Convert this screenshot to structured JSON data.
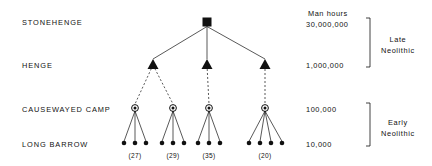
{
  "figure": {
    "type": "hierarchy-diagram",
    "background": "#ffffff",
    "ink": "#111111"
  },
  "row_labels": [
    {
      "id": "stonehenge",
      "label": "STONEHENGE",
      "x": 22,
      "y": 19,
      "node_y": 22
    },
    {
      "id": "henge",
      "label": "HENGE",
      "x": 22,
      "y": 62,
      "node_y": 64
    },
    {
      "id": "causewayed-camp",
      "label": "CAUSEWAYED CAMP",
      "x": 22,
      "y": 106,
      "node_y": 108
    },
    {
      "id": "long-barrow",
      "label": "LONG BARROW",
      "x": 22,
      "y": 141,
      "node_y": 143
    }
  ],
  "scale": {
    "heading": "Man hours",
    "heading_x": 308,
    "heading_y": 10,
    "values": [
      {
        "id": "30m",
        "text": "30,000,000",
        "x": 306,
        "y": 21
      },
      {
        "id": "1m",
        "text": "1,000,000",
        "x": 306,
        "y": 62
      },
      {
        "id": "100k",
        "text": "100,000",
        "x": 306,
        "y": 106
      },
      {
        "id": "10k",
        "text": "10,000",
        "x": 306,
        "y": 141
      }
    ]
  },
  "periods": [
    {
      "id": "late-neolithic",
      "line1": "Late",
      "line2": "Neolithic",
      "bracket_x": 370,
      "bracket_top": 18,
      "bracket_bottom": 67,
      "label_x": 381,
      "label_y": 34
    },
    {
      "id": "early-neolithic",
      "line1": "Early",
      "line2": "Neolithic",
      "bracket_x": 370,
      "bracket_top": 103,
      "bracket_bottom": 146,
      "label_x": 381,
      "label_y": 117
    }
  ],
  "nodes": {
    "stonehenge": {
      "x": 207,
      "y": 22,
      "shape": "filled-square",
      "size": 9
    },
    "henges": [
      {
        "id": "henge-1",
        "x": 153,
        "y": 64,
        "shape": "filled-triangle"
      },
      {
        "id": "henge-2",
        "x": 207,
        "y": 64,
        "shape": "filled-triangle"
      },
      {
        "id": "henge-3",
        "x": 265,
        "y": 64,
        "shape": "filled-triangle"
      }
    ],
    "camps": [
      {
        "id": "camp-1",
        "x": 135,
        "y": 108,
        "shape": "circled-dot",
        "parent": "henge-1",
        "barrow_count_label": "(27)",
        "barrows": 3
      },
      {
        "id": "camp-2",
        "x": 173,
        "y": 108,
        "shape": "circled-dot",
        "parent": "henge-1",
        "barrow_count_label": "(29)",
        "barrows": 3
      },
      {
        "id": "camp-3",
        "x": 209,
        "y": 108,
        "shape": "circled-dot",
        "parent": "henge-2",
        "barrow_count_label": "(35)",
        "barrows": 3
      },
      {
        "id": "camp-4",
        "x": 265,
        "y": 108,
        "shape": "circled-dot",
        "parent": "henge-3",
        "barrow_count_label": "(20)",
        "barrows": 4
      }
    ],
    "barrow_groups": [
      {
        "id": "barrows-1",
        "camp": "camp-1",
        "y": 143,
        "xs": [
          124,
          135,
          146
        ],
        "count_label": "(27)",
        "label_x": 135,
        "label_y": 153
      },
      {
        "id": "barrows-2",
        "camp": "camp-2",
        "y": 143,
        "xs": [
          162,
          173,
          184
        ],
        "count_label": "(29)",
        "label_x": 173,
        "label_y": 153
      },
      {
        "id": "barrows-3",
        "camp": "camp-3",
        "y": 143,
        "xs": [
          198,
          209,
          220
        ],
        "count_label": "(35)",
        "label_x": 209,
        "label_y": 153
      },
      {
        "id": "barrows-4",
        "camp": "camp-4",
        "y": 143,
        "xs": [
          249,
          260,
          271,
          282
        ],
        "count_label": "(20)",
        "label_x": 265,
        "label_y": 153
      }
    ]
  },
  "edges": {
    "stonehenge_to_henge_style": "solid",
    "henge_to_camp_style": "dashed",
    "camp_to_barrow_style": "solid"
  }
}
